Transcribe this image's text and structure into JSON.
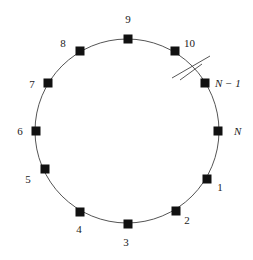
{
  "diagram": {
    "type": "ring-network",
    "circle": {
      "cx": 127,
      "cy": 131,
      "r": 92,
      "stroke": "#555555"
    },
    "node_color": "#111111",
    "break_mark": {
      "description": "double slash indicating omitted nodes between 10 and N-1"
    },
    "nodes": [
      {
        "label": "9",
        "x": 128,
        "y": 39,
        "lx": 128,
        "ly": 23,
        "anchor": "middle",
        "italic": false
      },
      {
        "label": "10",
        "x": 175,
        "y": 51,
        "lx": 184,
        "ly": 47,
        "anchor": "start",
        "italic": false
      },
      {
        "label": "N − 1",
        "x": 205,
        "y": 83,
        "lx": 215,
        "ly": 87,
        "anchor": "start",
        "italic": true
      },
      {
        "label": "N",
        "x": 218,
        "y": 131,
        "lx": 234,
        "ly": 135,
        "anchor": "start",
        "italic": true
      },
      {
        "label": "1",
        "x": 207,
        "y": 179,
        "lx": 220,
        "ly": 191,
        "anchor": "middle",
        "italic": false
      },
      {
        "label": "2",
        "x": 176,
        "y": 211,
        "lx": 187,
        "ly": 224,
        "anchor": "middle",
        "italic": false
      },
      {
        "label": "3",
        "x": 128,
        "y": 224,
        "lx": 126,
        "ly": 246,
        "anchor": "middle",
        "italic": false
      },
      {
        "label": "4",
        "x": 80,
        "y": 212,
        "lx": 79,
        "ly": 233,
        "anchor": "middle",
        "italic": false
      },
      {
        "label": "5",
        "x": 45,
        "y": 169,
        "lx": 28,
        "ly": 183,
        "anchor": "middle",
        "italic": false
      },
      {
        "label": "6",
        "x": 36,
        "y": 131,
        "lx": 20,
        "ly": 135,
        "anchor": "middle",
        "italic": false
      },
      {
        "label": "7",
        "x": 48,
        "y": 83,
        "lx": 32,
        "ly": 88,
        "anchor": "middle",
        "italic": false
      },
      {
        "label": "8",
        "x": 80,
        "y": 51,
        "lx": 63,
        "ly": 47,
        "anchor": "middle",
        "italic": false
      }
    ]
  }
}
